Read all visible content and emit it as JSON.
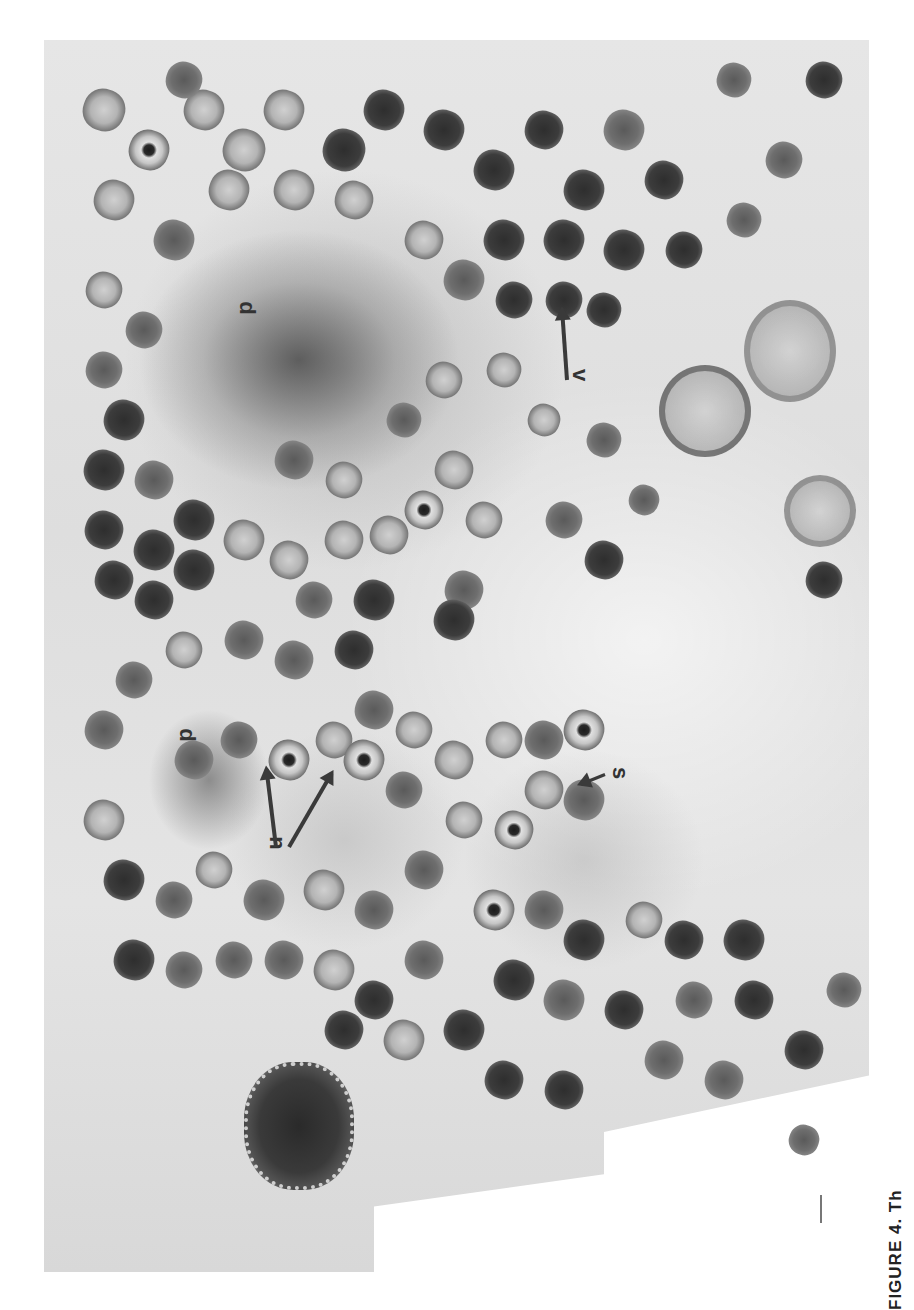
{
  "figure": {
    "type": "electron-micrograph",
    "labels": [
      {
        "id": "v",
        "text": "v",
        "meaning": "virion"
      },
      {
        "id": "d1",
        "text": "d",
        "meaning": "dense region (upper)"
      },
      {
        "id": "d2",
        "text": "d",
        "meaning": "dense region (lower)"
      },
      {
        "id": "n",
        "text": "n",
        "meaning": "nucleoid-containing particles"
      },
      {
        "id": "s",
        "text": "s",
        "meaning": "particle"
      }
    ],
    "scale_bar": true
  },
  "caption": {
    "text": "FIGURE 4.  Th"
  }
}
